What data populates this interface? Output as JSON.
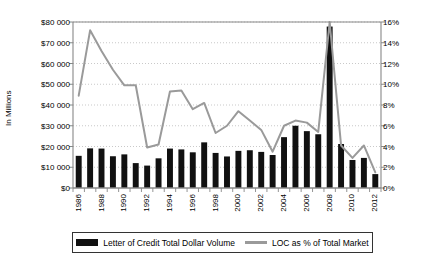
{
  "chart_data": {
    "type": "bar",
    "title": "",
    "xlabel": "",
    "ylabel": "In Millions",
    "ylabel_right": "",
    "grid": true,
    "legend_position": "bottom",
    "ylim": [
      0,
      80000
    ],
    "ylim_right": [
      0,
      16
    ],
    "categories": [
      "1986",
      "1987",
      "1988",
      "1989",
      "1990",
      "1991",
      "1992",
      "1993",
      "1994",
      "1995",
      "1996",
      "1997",
      "1998",
      "1999",
      "2000",
      "2001",
      "2002",
      "2003",
      "2004",
      "2005",
      "2006",
      "2007",
      "2008",
      "2009",
      "2010",
      "2011",
      "2012"
    ],
    "xtick_labels": [
      "1986",
      "",
      "1988",
      "",
      "1990",
      "",
      "1992",
      "",
      "1994",
      "",
      "1996",
      "",
      "1998",
      "",
      "2000",
      "",
      "2002",
      "",
      "2004",
      "",
      "2006",
      "",
      "2008",
      "",
      "2010",
      "",
      "2012"
    ],
    "ytick_labels_left": [
      "$80 000",
      "$70 000",
      "$60 000",
      "$50 000",
      "$40 000",
      "$30 000",
      "$20 000",
      "$10 000",
      "$0"
    ],
    "ytick_values_left": [
      80000,
      70000,
      60000,
      50000,
      40000,
      30000,
      20000,
      10000,
      0
    ],
    "ytick_labels_right": [
      "16%",
      "14%",
      "12%",
      "10%",
      "8%",
      "6%",
      "4%",
      "2%",
      "0%"
    ],
    "ytick_values_right": [
      16,
      14,
      12,
      10,
      8,
      6,
      4,
      2,
      0
    ],
    "series": [
      {
        "name": "Letter of Credit Total Dollar Volume",
        "type": "bar",
        "axis": "left",
        "color": "#111111",
        "values": [
          15500,
          19100,
          19000,
          15300,
          16200,
          12000,
          10800,
          14300,
          19000,
          18600,
          17200,
          22000,
          16900,
          15200,
          17900,
          18200,
          17400,
          15900,
          24500,
          30000,
          27400,
          25900,
          77800,
          21200,
          13500,
          14500,
          6700
        ]
      },
      {
        "name": "LOC as % of Total Market",
        "type": "line",
        "axis": "right",
        "color": "#9a9a9a",
        "values": [
          8.9,
          15.2,
          13.2,
          11.4,
          9.9,
          9.9,
          3.9,
          4.2,
          9.3,
          9.4,
          7.6,
          8.2,
          5.3,
          6.0,
          7.4,
          6.5,
          5.6,
          3.5,
          6.0,
          6.5,
          6.3,
          5.4,
          16.0,
          4.1,
          2.9,
          4.1,
          1.5
        ]
      }
    ]
  },
  "legend": {
    "items": [
      {
        "label": "Letter of Credit Total Dollar Volume",
        "marker": "bar-swatch"
      },
      {
        "label": "LOC as % of Total Market",
        "marker": "line-swatch"
      }
    ]
  },
  "colors": {
    "bar": "#111111",
    "line": "#9a9a9a",
    "axis": "#888888",
    "grid": "#bbbbbb",
    "text": "#000000",
    "background": "#ffffff"
  }
}
